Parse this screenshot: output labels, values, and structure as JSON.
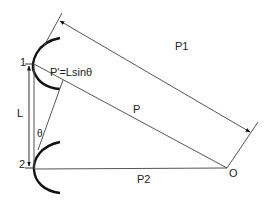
{
  "diagram": {
    "type": "geometry",
    "colors": {
      "line": "#555555",
      "mirror": "#111111",
      "text": "#222222"
    },
    "points": {
      "one": {
        "label": "1",
        "x": 34,
        "y": 64
      },
      "two": {
        "label": "2",
        "x": 34,
        "y": 169
      },
      "origin": {
        "label": "O",
        "x": 227,
        "y": 168
      }
    },
    "labels": {
      "point1": "1",
      "point2": "2",
      "L": "L",
      "theta": "θ",
      "p_prime": "P'=Lsinθ",
      "P1": "P1",
      "P": "P",
      "P2": "P2",
      "O": "O"
    },
    "segments": [
      {
        "name": "P",
        "from": "1",
        "to": "O"
      },
      {
        "name": "P2",
        "from": "2",
        "to": "O"
      },
      {
        "name": "P1",
        "type": "double-arrow",
        "parallel_to": "P"
      },
      {
        "name": "L",
        "type": "double-arrow",
        "from": "1",
        "to": "2"
      },
      {
        "name": "P'",
        "relation": "P'=Lsinθ"
      }
    ]
  }
}
